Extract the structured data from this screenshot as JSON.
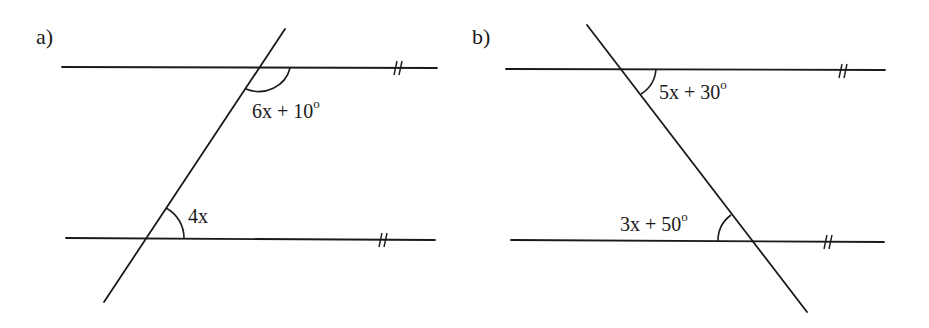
{
  "figures": [
    {
      "label": "a)",
      "lines": {
        "top": {
          "x1": 62,
          "y1": 67,
          "x2": 437,
          "y2": 68
        },
        "bottom": {
          "x1": 66,
          "y1": 238,
          "x2": 435,
          "y2": 240
        },
        "transversal": {
          "x1": 285,
          "y1": 29,
          "x2": 104,
          "y2": 302
        }
      },
      "parallel_mark": "//",
      "angles": [
        {
          "expr": "6x + 10",
          "degree_symbol": "o",
          "position": "top-intersection, below line, right of transversal"
        },
        {
          "expr": "4x",
          "degree_symbol": "",
          "position": "bottom-intersection, above line, right of transversal"
        }
      ]
    },
    {
      "label": "b)",
      "lines": {
        "top": {
          "x1": 506,
          "y1": 69,
          "x2": 885,
          "y2": 70
        },
        "bottom": {
          "x1": 511,
          "y1": 240,
          "x2": 884,
          "y2": 242
        },
        "transversal": {
          "x1": 587,
          "y1": 25,
          "x2": 807,
          "y2": 312
        }
      },
      "parallel_mark": "//",
      "angles": [
        {
          "expr": "5x + 30",
          "degree_symbol": "o",
          "position": "top-intersection, below line, right of transversal"
        },
        {
          "expr": "3x + 50",
          "degree_symbol": "o",
          "position": "bottom-intersection, above line, left of transversal"
        }
      ]
    }
  ],
  "colors": {
    "ink": "#1a1a1a",
    "background": "#ffffff"
  }
}
